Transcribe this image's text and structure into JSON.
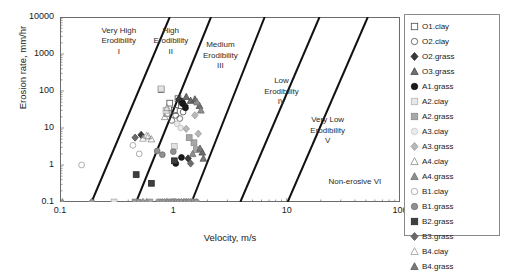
{
  "chart_data": {
    "type": "scatter",
    "title": "",
    "xlabel": "Velocity, m/s",
    "ylabel": "Erosion rate, mm/hr",
    "xscale": "log",
    "yscale": "log",
    "xlim": [
      0.1,
      100
    ],
    "ylim": [
      0.1,
      10000
    ],
    "xticks": [
      "0.1",
      "1",
      "10",
      "100"
    ],
    "yticks": [
      "0.1",
      "1",
      "10",
      "100",
      "1000",
      "10000"
    ],
    "grid": false,
    "legend_position": "right-outside",
    "zones": [
      {
        "id": "I",
        "label": "Very High\nErodibility\nI",
        "x": 0.33,
        "y": 2200
      },
      {
        "id": "II",
        "label": "High\nErodibility\nII",
        "x": 0.95,
        "y": 2200
      },
      {
        "id": "III",
        "label": "Medium\nErodibility\nIII",
        "x": 2.6,
        "y": 900
      },
      {
        "id": "IV",
        "label": "Low\nErodibility\nIV",
        "x": 9.0,
        "y": 95
      },
      {
        "id": "V",
        "label": "Very Low\nErodibility\nV",
        "x": 23.0,
        "y": 8.5
      },
      {
        "id": "VI",
        "label": "Non-erosive VI",
        "x": 40.0,
        "y": 0.34
      }
    ],
    "boundary_lines": [
      {
        "name": "I-II",
        "p1": [
          0.19,
          0.1
        ],
        "p2": [
          0.93,
          10000
        ]
      },
      {
        "name": "II-III",
        "p1": [
          0.47,
          0.1
        ],
        "p2": [
          2.15,
          10000
        ]
      },
      {
        "name": "III-IV",
        "p1": [
          1.45,
          0.1
        ],
        "p2": [
          6.4,
          10000
        ]
      },
      {
        "name": "IV-V",
        "p1": [
          3.9,
          0.1
        ],
        "p2": [
          19.5,
          10000
        ]
      },
      {
        "name": "V-VI",
        "p1": [
          10.2,
          0.1
        ],
        "p2": [
          52.0,
          10000
        ]
      }
    ],
    "series": [
      {
        "name": "O1.clay",
        "marker": "square",
        "fill": "none",
        "edge": "#4d4d4d",
        "points": [
          [
            0.78,
            110
          ],
          [
            0.93,
            47
          ],
          [
            1.02,
            30
          ],
          [
            1.1,
            62
          ],
          [
            1.18,
            40
          ],
          [
            0.88,
            25
          ]
        ]
      },
      {
        "name": "O2.clay",
        "marker": "circle",
        "fill": "none",
        "edge": "#4d4d4d",
        "points": [
          [
            1.05,
            22
          ],
          [
            1.14,
            18
          ],
          [
            1.22,
            27
          ],
          [
            0.97,
            16
          ]
        ]
      },
      {
        "name": "O2.grass",
        "marker": "diamond",
        "fill": "#3a3a3a",
        "edge": "#2a2a2a",
        "points": [
          [
            1.12,
            60
          ],
          [
            1.2,
            52
          ],
          [
            1.27,
            40
          ],
          [
            1.35,
            1.5
          ],
          [
            0.52,
            6.5
          ]
        ]
      },
      {
        "name": "O3.grass",
        "marker": "triangle",
        "fill": "#6e6e6e",
        "edge": "#4a4a4a",
        "points": [
          [
            1.3,
            70
          ],
          [
            1.42,
            55
          ],
          [
            1.55,
            60
          ],
          [
            1.7,
            40
          ],
          [
            1.8,
            2.2
          ]
        ]
      },
      {
        "name": "A1.grass",
        "marker": "circle",
        "fill": "#1a1a1a",
        "edge": "#111111",
        "points": [
          [
            1.2,
            46
          ],
          [
            1.28,
            35
          ],
          [
            1.18,
            1.6
          ],
          [
            1.05,
            1.1
          ]
        ]
      },
      {
        "name": "A2.clay",
        "marker": "square",
        "fill": "#e2e2e2",
        "edge": "#b0b0b0",
        "points": [
          [
            0.78,
            115
          ],
          [
            0.86,
            30
          ],
          [
            0.3,
            0.1
          ],
          [
            1.02,
            3.2
          ]
        ]
      },
      {
        "name": "A2.grass",
        "marker": "square",
        "fill": "#a8a8a8",
        "edge": "#8a8a8a",
        "points": [
          [
            1.52,
            4.0
          ],
          [
            1.6,
            2.6
          ],
          [
            1.38,
            5.5
          ],
          [
            0.62,
            0.1
          ]
        ]
      },
      {
        "name": "A3.clay",
        "marker": "circle",
        "fill": "#e8e8e8",
        "edge": "#c0c0c0",
        "points": [
          [
            1.08,
            13
          ],
          [
            1.16,
            10
          ],
          [
            0.95,
            0.1
          ]
        ]
      },
      {
        "name": "A3.grass",
        "marker": "diamond",
        "fill": "#b8b8b8",
        "edge": "#9a9a9a",
        "points": [
          [
            1.55,
            22
          ],
          [
            1.66,
            7.0
          ],
          [
            1.3,
            9.5
          ]
        ]
      },
      {
        "name": "A4.clay",
        "marker": "triangle",
        "fill": "none",
        "edge": "#8a8a8a",
        "points": [
          [
            0.88,
            35
          ],
          [
            0.84,
            20
          ],
          [
            0.6,
            6.0
          ],
          [
            0.64,
            5.0
          ]
        ]
      },
      {
        "name": "A4.grass",
        "marker": "triangle",
        "fill": "#8e8e8e",
        "edge": "#6e6e6e",
        "points": [
          [
            1.62,
            50
          ],
          [
            1.75,
            30
          ],
          [
            1.48,
            2.0
          ],
          [
            1.3,
            0.1
          ]
        ]
      },
      {
        "name": "B1.clay",
        "marker": "circle",
        "fill": "none",
        "edge": "#9a9a9a",
        "points": [
          [
            0.155,
            1.0
          ],
          [
            0.44,
            3.4
          ],
          [
            0.5,
            2.0
          ]
        ]
      },
      {
        "name": "B1.grass",
        "marker": "circle",
        "fill": "#909090",
        "edge": "#707070",
        "points": [
          [
            0.72,
            2.4
          ],
          [
            0.8,
            1.9
          ],
          [
            1.0,
            2.3
          ]
        ]
      },
      {
        "name": "B2.grass",
        "marker": "square",
        "fill": "#3f3f3f",
        "edge": "#2a2a2a",
        "points": [
          [
            0.47,
            0.55
          ],
          [
            0.64,
            0.32
          ],
          [
            1.02,
            1.3
          ]
        ]
      },
      {
        "name": "B3.grass",
        "marker": "diamond",
        "fill": "#6a6a6a",
        "edge": "#555555",
        "points": [
          [
            0.46,
            5.5
          ],
          [
            1.42,
            1.1
          ]
        ]
      },
      {
        "name": "B4.clay",
        "marker": "triangle",
        "fill": "none",
        "edge": "#9a9a9a",
        "points": [
          [
            0.58,
            6.2
          ],
          [
            0.54,
            5.2
          ]
        ]
      },
      {
        "name": "B4.grass",
        "marker": "triangle",
        "fill": "#7a7a7a",
        "edge": "#5a5a5a",
        "points": [
          [
            1.72,
            2.8
          ],
          [
            1.84,
            1.5
          ]
        ]
      },
      {
        "name": "baseline",
        "marker": "mixed",
        "fill": "#9a9a9a",
        "edge": "#7a7a7a",
        "points": [
          [
            0.46,
            0.1
          ],
          [
            0.5,
            0.1
          ],
          [
            0.54,
            0.1
          ],
          [
            0.58,
            0.1
          ],
          [
            0.76,
            0.1
          ],
          [
            0.8,
            0.1
          ],
          [
            0.84,
            0.1
          ],
          [
            0.88,
            0.1
          ],
          [
            0.92,
            0.1
          ],
          [
            0.96,
            0.1
          ],
          [
            1.0,
            0.1
          ],
          [
            1.04,
            0.1
          ],
          [
            1.08,
            0.1
          ],
          [
            1.12,
            0.1
          ],
          [
            1.18,
            0.1
          ],
          [
            1.24,
            0.1
          ],
          [
            1.3,
            0.1
          ],
          [
            1.36,
            0.1
          ],
          [
            1.42,
            0.1
          ],
          [
            1.48,
            0.1
          ],
          [
            1.54,
            0.1
          ],
          [
            1.6,
            0.1
          ],
          [
            0.19,
            0.1
          ],
          [
            0.105,
            0.1
          ]
        ]
      }
    ]
  },
  "legend": {
    "items": [
      {
        "label": "O1.clay",
        "marker": "square",
        "fill": "none",
        "edge": "#4d4d4d"
      },
      {
        "label": "O2.clay",
        "marker": "circle",
        "fill": "none",
        "edge": "#4d4d4d"
      },
      {
        "label": "O2.grass",
        "marker": "diamond",
        "fill": "#3a3a3a",
        "edge": "#2a2a2a"
      },
      {
        "label": "O3.grass",
        "marker": "triangle",
        "fill": "#6e6e6e",
        "edge": "#4a4a4a"
      },
      {
        "label": "A1.grass",
        "marker": "circle",
        "fill": "#1a1a1a",
        "edge": "#111111"
      },
      {
        "label": "A2.clay",
        "marker": "square",
        "fill": "#e8e8e8",
        "edge": "#b5b5b5"
      },
      {
        "label": "A2.grass",
        "marker": "square",
        "fill": "#a8a8a8",
        "edge": "#8a8a8a"
      },
      {
        "label": "A3.clay",
        "marker": "circle",
        "fill": "#ececec",
        "edge": "#c4c4c4"
      },
      {
        "label": "A3.grass",
        "marker": "diamond",
        "fill": "#b8b8b8",
        "edge": "#9a9a9a"
      },
      {
        "label": "A4.clay",
        "marker": "triangle",
        "fill": "none",
        "edge": "#8a8a8a"
      },
      {
        "label": "A4.grass",
        "marker": "triangle",
        "fill": "#8e8e8e",
        "edge": "#6e6e6e"
      },
      {
        "label": "B1.clay",
        "marker": "circle",
        "fill": "none",
        "edge": "#9a9a9a"
      },
      {
        "label": "B1.grass",
        "marker": "circle",
        "fill": "#909090",
        "edge": "#707070"
      },
      {
        "label": "B2.grass",
        "marker": "square",
        "fill": "#3f3f3f",
        "edge": "#2a2a2a"
      },
      {
        "label": "B3.grass",
        "marker": "diamond",
        "fill": "#6a6a6a",
        "edge": "#555555"
      },
      {
        "label": "B4.clay",
        "marker": "triangle",
        "fill": "none",
        "edge": "#9a9a9a"
      },
      {
        "label": "B4.grass",
        "marker": "triangle",
        "fill": "#7a7a7a",
        "edge": "#5a5a5a"
      }
    ]
  }
}
